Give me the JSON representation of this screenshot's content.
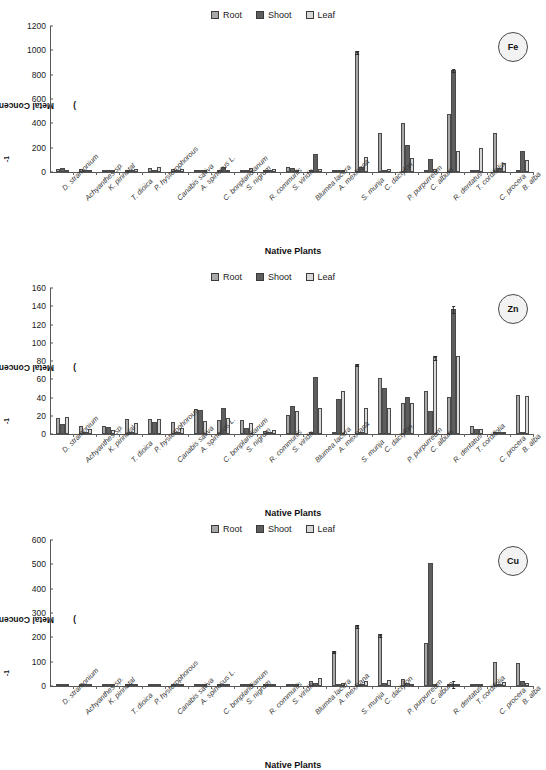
{
  "figure": {
    "legend": [
      {
        "label": "Root",
        "color": "#a8a8a8",
        "icon": "legend-swatch-root"
      },
      {
        "label": "Shoot",
        "color": "#5e5e5e",
        "icon": "legend-swatch-shoot"
      },
      {
        "label": "Leaf",
        "color": "#d8d8d8",
        "icon": "legend-swatch-leaf"
      }
    ],
    "ylabel": "Metal Concentration (mg kg",
    "ylabel_sup": "-1",
    "ylabel_close": ")",
    "xlabel": "Native Plants"
  },
  "chart_data": [
    {
      "type": "bar",
      "title": "Fe",
      "badge": "Fe",
      "xlabel": "Native Plants",
      "ylabel": "Metal Concentration (mg kg-1)",
      "ylim": [
        0,
        1200
      ],
      "yticks": [
        0,
        200,
        400,
        600,
        800,
        1000,
        1200
      ],
      "grid": false,
      "legend_position": "top-center",
      "categories": [
        "D. stramonium",
        "Achyanthes sp.",
        "K. pinnatal",
        "T. dioica",
        "P. hysterophorous",
        "Canabis sativa",
        "A. spinosus L.",
        "C. bonplandianum",
        "S. nigrum",
        "R. communis",
        "S. viridis",
        "Blumea lacera",
        "A. mexicana",
        "S. munja",
        "C. dactylon",
        "P. purpurreum",
        "C. album",
        "R. dentatus",
        "T. cordifolia",
        "C. procera",
        "B. alba"
      ],
      "series": [
        {
          "name": "Root",
          "values": [
            22,
            24,
            8,
            14,
            35,
            22,
            17,
            12,
            6,
            3,
            38,
            10,
            5,
            985,
            320,
            405,
            3,
            480,
            12,
            320,
            4
          ]
        },
        {
          "name": "Shoot",
          "values": [
            33,
            20,
            10,
            6,
            10,
            10,
            12,
            45,
            4,
            2,
            33,
            150,
            6,
            38,
            10,
            225,
            108,
            840,
            8,
            35,
            170
          ]
        },
        {
          "name": "Leaf",
          "values": [
            8,
            10,
            4,
            28,
            43,
            25,
            5,
            18,
            35,
            22,
            20,
            25,
            3,
            122,
            28,
            112,
            25,
            172,
            196,
            75,
            100
          ]
        }
      ],
      "errors": [
        {
          "category": "S. munja",
          "series": "Root",
          "value": 985,
          "err": 18
        },
        {
          "category": "R. dentatus",
          "series": "Shoot",
          "value": 840,
          "err": 14
        }
      ]
    },
    {
      "type": "bar",
      "title": "Zn",
      "badge": "Zn",
      "xlabel": "Native Plants",
      "ylabel": "Metal Concentration (mg kg-1)",
      "ylim": [
        0,
        160
      ],
      "yticks": [
        0,
        20,
        40,
        60,
        80,
        100,
        120,
        140,
        160
      ],
      "grid": false,
      "legend_position": "top-center",
      "categories": [
        "D. stramonium",
        "Achyanthes sp.",
        "K. pinnatal",
        "T. dioica",
        "P. hysterophorous",
        "Canabis sativa",
        "A. spinosus L.",
        "C. bonplandianum",
        "S. nigrum",
        "R. communis",
        "S. viridis",
        "Blumea lacera",
        "A. mexicana",
        "S. munja",
        "C. dactylon",
        "P. purpurreum",
        "C. album",
        "R. dentatus",
        "T. cordifolia",
        "C. procera",
        "B. alba"
      ],
      "series": [
        {
          "name": "Root",
          "values": [
            18,
            9,
            9,
            16,
            16,
            13,
            27,
            15,
            15,
            3,
            21,
            1,
            1,
            76,
            61,
            34,
            47,
            41,
            9,
            0,
            43
          ]
        },
        {
          "name": "Shoot",
          "values": [
            11,
            1,
            8,
            2,
            13,
            2,
            26,
            28,
            7,
            2,
            31,
            63,
            38,
            1,
            50,
            41,
            25,
            137,
            5,
            0,
            2
          ]
        },
        {
          "name": "Leaf",
          "values": [
            19,
            6,
            4,
            12,
            16,
            7,
            14,
            18,
            12,
            4,
            25,
            28,
            47,
            28,
            29,
            34,
            84,
            85,
            5,
            0,
            42
          ]
        }
      ],
      "errors": [
        {
          "category": "R. dentatus",
          "series": "Shoot",
          "value": 137,
          "err": 4
        },
        {
          "category": "S. munja",
          "series": "Root",
          "value": 76,
          "err": 2
        },
        {
          "category": "C. album",
          "series": "Leaf",
          "value": 84,
          "err": 3
        }
      ]
    },
    {
      "type": "bar",
      "title": "Cu",
      "badge": "Cu",
      "xlabel": "Native Plants",
      "ylabel": "Metal Concentration (mg kg-1)",
      "ylim": [
        0,
        600
      ],
      "yticks": [
        0,
        100,
        200,
        300,
        400,
        500,
        600
      ],
      "grid": false,
      "legend_position": "top-center",
      "categories": [
        "D. stramonium",
        "Achyanthes sp.",
        "K. pinnatal",
        "T. dioica",
        "P. hysterophorous",
        "Canabis sativa",
        "A. spinosus L.",
        "C. bonplandianum",
        "S. nigrum",
        "R. communis",
        "S. viridis",
        "Blumea lacera",
        "A. mexicana",
        "S. munja",
        "C. dactylon",
        "P. purpurreum",
        "C. album",
        "R. dentatus",
        "T. cordifolia",
        "C. procera",
        "B. alba"
      ],
      "series": [
        {
          "name": "Root",
          "values": [
            3,
            2,
            6,
            2,
            2,
            2,
            3,
            6,
            3,
            2,
            3,
            20,
            140,
            245,
            208,
            30,
            175,
            3,
            5,
            100,
            95
          ]
        },
        {
          "name": "Shoot",
          "values": [
            2,
            2,
            3,
            2,
            2,
            2,
            2,
            4,
            2,
            2,
            3,
            12,
            8,
            5,
            12,
            14,
            505,
            2,
            3,
            10,
            20
          ]
        },
        {
          "name": "Leaf",
          "values": [
            2,
            2,
            2,
            2,
            2,
            2,
            2,
            3,
            2,
            2,
            8,
            32,
            12,
            20,
            25,
            10,
            10,
            4,
            8,
            15,
            14
          ]
        }
      ],
      "errors": [
        {
          "category": "R. dentatus",
          "series": "Shoot",
          "value": 505,
          "err": 16
        },
        {
          "category": "S. munja",
          "series": "Root",
          "value": 245,
          "err": 8
        },
        {
          "category": "C. dactylon",
          "series": "Root",
          "value": 208,
          "err": 8
        },
        {
          "category": "A. mexicana",
          "series": "Root",
          "value": 140,
          "err": 6
        }
      ]
    }
  ]
}
